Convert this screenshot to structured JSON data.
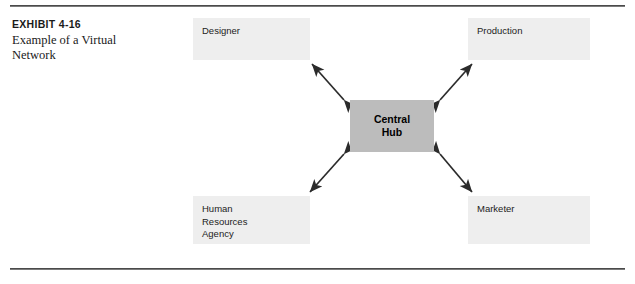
{
  "exhibit": {
    "title": "EXHIBIT 4-16",
    "subtitle": "Example of a Virtual Network"
  },
  "diagram": {
    "hub": {
      "label": "Central\nHub",
      "fill": "#bcbcbc"
    },
    "nodes": [
      {
        "id": "designer",
        "label": "Designer",
        "fill": "#eeeeee"
      },
      {
        "id": "production",
        "label": "Production",
        "fill": "#eeeeee"
      },
      {
        "id": "hr",
        "label": "Human\nResources\nAgency",
        "fill": "#eeeeee"
      },
      {
        "id": "marketer",
        "label": "Marketer",
        "fill": "#eeeeee"
      }
    ],
    "connectors": [
      {
        "id": "hub-designer",
        "from": "central-hub",
        "to": "designer",
        "style": "double-arrow"
      },
      {
        "id": "hub-production",
        "from": "central-hub",
        "to": "production",
        "style": "double-arrow"
      },
      {
        "id": "hub-hr",
        "from": "central-hub",
        "to": "hr",
        "style": "double-arrow"
      },
      {
        "id": "hub-marketer",
        "from": "central-hub",
        "to": "marketer",
        "style": "double-arrow"
      }
    ],
    "line_color": "#2b2b2b",
    "rule_color": "#4a4a4a"
  }
}
